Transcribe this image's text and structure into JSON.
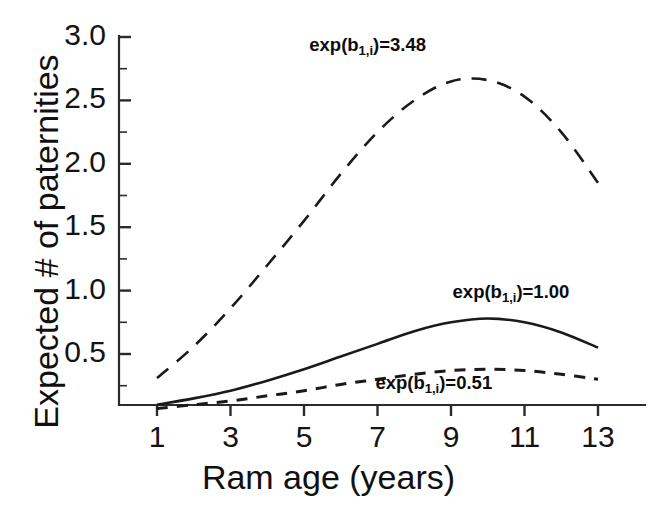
{
  "chart_data": {
    "type": "line",
    "title": "",
    "xlabel": "Ram age (years)",
    "ylabel": "Expected # of paternities",
    "xlim": [
      0.45,
      13.6
    ],
    "ylim": [
      0.0,
      3.05
    ],
    "grid": false,
    "legend_position": "inline-annotations",
    "xticks": [
      "1",
      "3",
      "5",
      "7",
      "9",
      "11",
      "13"
    ],
    "xtick_values": [
      1,
      3,
      5,
      7,
      9,
      11,
      13
    ],
    "yticks": [
      "0.5",
      "1.0",
      "1.5",
      "2.0",
      "2.5",
      "3.0"
    ],
    "ytick_values": [
      0.5,
      1.0,
      1.5,
      2.0,
      2.5,
      3.0
    ],
    "minor_ytick_values": [
      0.25,
      0.75,
      1.25,
      1.75,
      2.25,
      2.75
    ],
    "x": [
      1,
      2,
      3,
      4,
      5,
      6,
      7,
      8,
      9,
      10,
      11,
      12,
      13
    ],
    "series": [
      {
        "name": "exp(b1,i)=3.48",
        "style": "long-dash",
        "values": [
          0.31,
          0.56,
          0.86,
          1.2,
          1.55,
          1.92,
          2.25,
          2.5,
          2.65,
          2.66,
          2.53,
          2.25,
          1.85
        ]
      },
      {
        "name": "exp(b1,i)=1.00",
        "style": "solid",
        "values": [
          0.1,
          0.15,
          0.21,
          0.29,
          0.38,
          0.48,
          0.58,
          0.68,
          0.75,
          0.78,
          0.75,
          0.67,
          0.55
        ]
      },
      {
        "name": "exp(b1,i)=0.51",
        "style": "short-dash",
        "values": [
          0.07,
          0.1,
          0.13,
          0.17,
          0.21,
          0.26,
          0.3,
          0.34,
          0.37,
          0.38,
          0.37,
          0.34,
          0.3
        ]
      }
    ],
    "annotations": [
      {
        "text_prefix": "exp(b",
        "subscript": "1,i",
        "text_suffix": ")=3.48",
        "x": 8.0,
        "y": 2.93
      },
      {
        "text_prefix": "exp(b",
        "subscript": "1,i",
        "text_suffix": ")=1.00",
        "x": 11.9,
        "y": 0.98
      },
      {
        "text_prefix": "exp(b",
        "subscript": "1,i",
        "text_suffix": ")=0.51",
        "x": 9.8,
        "y": 0.26
      }
    ]
  },
  "axes": {
    "y_title": "Expected # of paternities",
    "x_title": "Ram age (years)"
  }
}
